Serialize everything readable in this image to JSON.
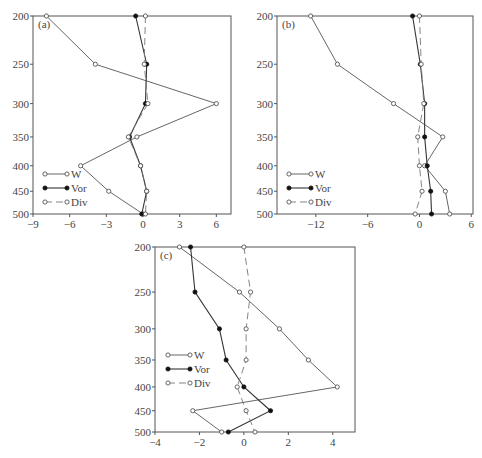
{
  "chart_data": [
    {
      "type": "line",
      "panel": "(a)",
      "orientation": "vertical-profile",
      "ylabel": "",
      "xlabel": "",
      "y": [
        200,
        250,
        300,
        350,
        400,
        450,
        500
      ],
      "yticks": [
        200,
        250,
        300,
        350,
        400,
        450,
        500
      ],
      "yscale": "log",
      "ylim": [
        500,
        200
      ],
      "xticks": [
        -9,
        -6,
        -3,
        0,
        3,
        6
      ],
      "xlim": [
        -9,
        7.2
      ],
      "series": [
        {
          "name": "W",
          "marker": "open-circle",
          "line": "solid",
          "values": [
            -7.9,
            -3.9,
            6.0,
            -0.5,
            -5.1,
            -2.8,
            0.0
          ]
        },
        {
          "name": "Vor",
          "marker": "filled-circle",
          "line": "solid",
          "values": [
            -0.6,
            0.3,
            0.2,
            -1.1,
            -0.2,
            0.3,
            -0.1
          ]
        },
        {
          "name": "Div",
          "marker": "open-circle",
          "line": "dashed",
          "values": [
            0.2,
            0.1,
            0.4,
            -1.2,
            -0.2,
            0.3,
            0.2
          ]
        }
      ],
      "legend": [
        "W",
        "Vor",
        "Div"
      ],
      "legend_position": "lower-left",
      "grid": false
    },
    {
      "type": "line",
      "panel": "(b)",
      "orientation": "vertical-profile",
      "ylabel": "",
      "xlabel": "",
      "y": [
        200,
        250,
        300,
        350,
        400,
        450,
        500
      ],
      "yticks": [
        200,
        250,
        300,
        350,
        400,
        450,
        500
      ],
      "yscale": "log",
      "ylim": [
        500,
        200
      ],
      "xticks": [
        -12,
        -6,
        0,
        6
      ],
      "xlim": [
        -16.5,
        6.2
      ],
      "series": [
        {
          "name": "W",
          "marker": "open-circle",
          "line": "solid",
          "values": [
            -12.6,
            -9.5,
            -3.0,
            2.7,
            0.6,
            3.0,
            3.5
          ]
        },
        {
          "name": "Vor",
          "marker": "filled-circle",
          "line": "solid",
          "values": [
            -0.8,
            0.1,
            0.6,
            0.6,
            0.9,
            1.3,
            1.4
          ]
        },
        {
          "name": "Div",
          "marker": "open-circle",
          "line": "dashed",
          "values": [
            0.0,
            0.2,
            0.5,
            -0.2,
            0.0,
            0.3,
            -0.5
          ]
        }
      ],
      "legend": [
        "W",
        "Vor",
        "Div"
      ],
      "legend_position": "lower-left",
      "grid": false
    },
    {
      "type": "line",
      "panel": "(c)",
      "orientation": "vertical-profile",
      "ylabel": "",
      "xlabel": "",
      "y": [
        200,
        250,
        300,
        350,
        400,
        450,
        500
      ],
      "yticks": [
        200,
        250,
        300,
        350,
        400,
        450,
        500
      ],
      "yscale": "log",
      "ylim": [
        500,
        200
      ],
      "xticks": [
        -4,
        -2,
        0,
        2,
        4
      ],
      "xlim": [
        -4,
        5
      ],
      "series": [
        {
          "name": "W",
          "marker": "open-circle",
          "line": "solid",
          "values": [
            -2.9,
            -0.2,
            1.6,
            2.9,
            4.2,
            -2.3,
            -1.0
          ]
        },
        {
          "name": "Vor",
          "marker": "filled-circle",
          "line": "solid",
          "values": [
            -2.4,
            -2.2,
            -1.1,
            -0.8,
            0.0,
            1.2,
            -0.7
          ]
        },
        {
          "name": "Div",
          "marker": "open-circle",
          "line": "dashed",
          "values": [
            0.0,
            0.3,
            0.1,
            0.1,
            -0.3,
            0.1,
            0.5
          ]
        }
      ],
      "legend": [
        "W",
        "Vor",
        "Div"
      ],
      "legend_position": "middle-left",
      "grid": false
    }
  ],
  "panels": [
    {
      "label": "(a)",
      "box": {
        "left": 33,
        "top": 16,
        "right": 231,
        "bottom": 214
      },
      "legend": {
        "x": 45,
        "y": 174,
        "dy": 14
      }
    },
    {
      "label": "(b)",
      "box": {
        "left": 277,
        "top": 16,
        "right": 473,
        "bottom": 214
      },
      "legend": {
        "x": 289,
        "y": 174,
        "dy": 14
      }
    },
    {
      "label": "(c)",
      "box": {
        "left": 155,
        "top": 247,
        "right": 355,
        "bottom": 432
      },
      "legend": {
        "x": 168,
        "y": 355,
        "dy": 14
      }
    }
  ]
}
